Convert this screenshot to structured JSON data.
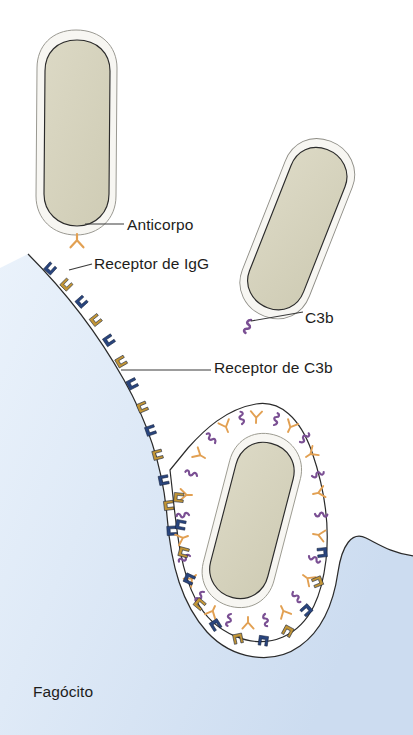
{
  "figure": {
    "background_color": "#ffffff",
    "width": 413,
    "height": 735
  },
  "labels": {
    "antibody": "Anticorpo",
    "igg_receptor": "Receptor de IgG",
    "c3b": "C3b",
    "c3b_receptor": "Receptor de C3b",
    "phagocyte": "Fagócito"
  },
  "colors": {
    "phagocyte_fill": "#dbe7f6",
    "phagocyte_fill_light": "#eaf2fb",
    "phagocyte_edge": "#2b2b2b",
    "bacterium_body": "#d6d3bd",
    "bacterium_capsule": "#f6f5f1",
    "bacterium_outline": "#2b2b2b",
    "igg_receptor_color": "#29457e",
    "c3b_receptor_color": "#c29536",
    "antibody_color": "#e2a052",
    "c3b_color": "#7a4f93",
    "label_text": "#1d1d1b",
    "leader_line": "#3a3a3a"
  },
  "elements": {
    "free_bacteria_count": 2,
    "engulfed_bacteria_count": 1,
    "membrane_receptor_count": 34,
    "opsonin_types": [
      "Anticorpo",
      "C3b"
    ],
    "receptor_types": [
      "Receptor de IgG",
      "Receptor de C3b"
    ]
  }
}
